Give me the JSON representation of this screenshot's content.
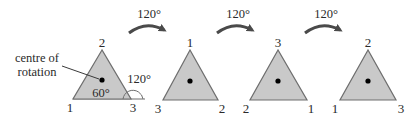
{
  "diagram": {
    "colors": {
      "triangle_fill": "#c9c9c9",
      "triangle_stroke": "#6e6e6e",
      "arrow": "#4a4a4a",
      "text": "#2a2a2a",
      "dot": "#000000"
    },
    "annotation": {
      "centre_label_line1": "centre of",
      "centre_label_line2": "rotation",
      "interior_angle": "60°",
      "exterior_angle": "120°"
    },
    "arrows": [
      {
        "label": "120°"
      },
      {
        "label": "120°"
      },
      {
        "label": "120°"
      }
    ],
    "triangles": [
      {
        "top": "2",
        "bottom_left": "1",
        "bottom_right": "3"
      },
      {
        "top": "1",
        "bottom_left": "3",
        "bottom_right": "2"
      },
      {
        "top": "3",
        "bottom_left": "2",
        "bottom_right": "1"
      },
      {
        "top": "2",
        "bottom_left": "1",
        "bottom_right": "3"
      }
    ]
  }
}
